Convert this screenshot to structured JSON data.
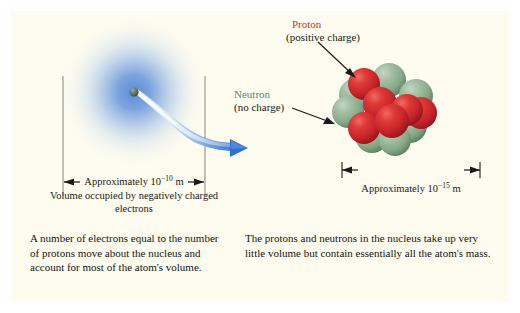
{
  "figure": {
    "background_color": "#ffffff",
    "panel_color": "#fdfcef"
  },
  "left_panel": {
    "electron_cloud": {
      "name": "electron-cloud",
      "color": "#2f6fd0"
    },
    "electron": {
      "name": "electron-particle",
      "color": "#5a6b63"
    },
    "motion_arrow": {
      "name": "electron-motion-arrow",
      "color": "#2f6fd0"
    },
    "dimension": {
      "text_prefix": "Approximately 10",
      "exponent": "−10",
      "text_suffix": " m",
      "full_text": "Approximately 10−10 m"
    },
    "cloud_caption": "Volume occupied by negatively charged electrons",
    "body_caption": "A number of electrons equal to the number of protons move about the nucleus and account for most of the atom's volume."
  },
  "right_panel": {
    "proton": {
      "name": "Proton",
      "sub": "(positive charge)",
      "color": "#c0392b",
      "sphere_color": "#c8252c"
    },
    "neutron": {
      "name": "Neutron",
      "sub": "(no charge)",
      "color": "#4e8f63",
      "sphere_color": "#8fae90"
    },
    "dimension": {
      "text_prefix": "Approximately 10",
      "exponent": "−15",
      "text_suffix": " m",
      "full_text": "Approximately 10−15 m"
    },
    "body_caption": "The protons and neutrons in the nucleus take up very little volume but contain essentially all the atom's mass."
  }
}
